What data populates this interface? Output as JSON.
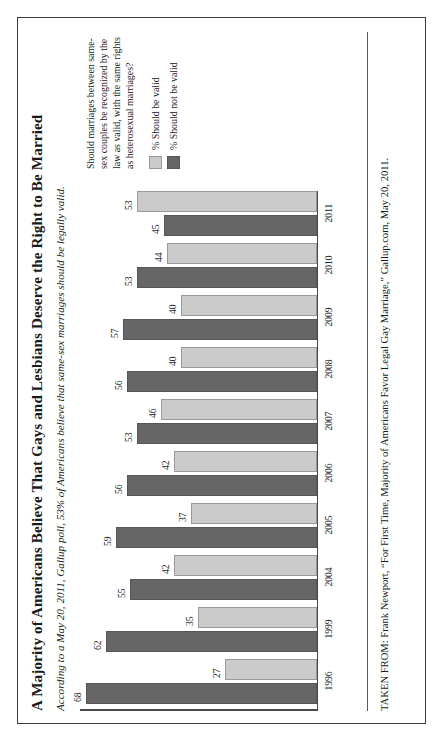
{
  "title": "A Majority of Americans Believe That Gays and Lesbians Deserve the Right to Be Married",
  "subtitle": "According to a May 20, 2011, Gallup poll, 53% of Americans believe that same-sex marriages should be legally valid.",
  "question": "Should marriages between same-sex couples be recognized by the law as valid, with the same rights as heterosexual marriages?",
  "legend": [
    {
      "label": "% Should be valid",
      "color": "#cbcbcb",
      "key": "should_be_valid"
    },
    {
      "label": "% Should not be valid",
      "color": "#666666",
      "key": "should_not_be_valid"
    }
  ],
  "source": "TAKEN FROM: Frank Newport, “For First Time, Majority of Americans Favor Legal Gay Marriage,” Gallup.com, May 20, 2011.",
  "colors": {
    "dark_bar": "#666666",
    "light_bar": "#cbcbcb",
    "frame": "#3a3a3a",
    "axis": "#4a4a4a",
    "text": "#1a1a1a"
  },
  "chart_data": {
    "type": "bar",
    "title": "A Majority of Americans Believe That Gays and Lesbians Deserve the Right to Be Married",
    "subtitle": "According to a May 20, 2011, Gallup poll, 53% of Americans believe that same-sex marriages should be legally valid.",
    "xlabel": "",
    "ylabel": "",
    "ylim": [
      0,
      70
    ],
    "grid": false,
    "legend_position": "right",
    "orientation": "vertical",
    "categories": [
      "1996",
      "1999",
      "2004",
      "2005",
      "2006",
      "2007",
      "2008",
      "2009",
      "2010",
      "2011"
    ],
    "series": [
      {
        "name": "% Should not be valid",
        "color": "#666666",
        "values": [
          68,
          62,
          55,
          59,
          56,
          53,
          56,
          57,
          53,
          45
        ]
      },
      {
        "name": "% Should be valid",
        "color": "#cbcbcb",
        "values": [
          27,
          35,
          42,
          37,
          42,
          46,
          40,
          40,
          44,
          53
        ]
      }
    ]
  }
}
